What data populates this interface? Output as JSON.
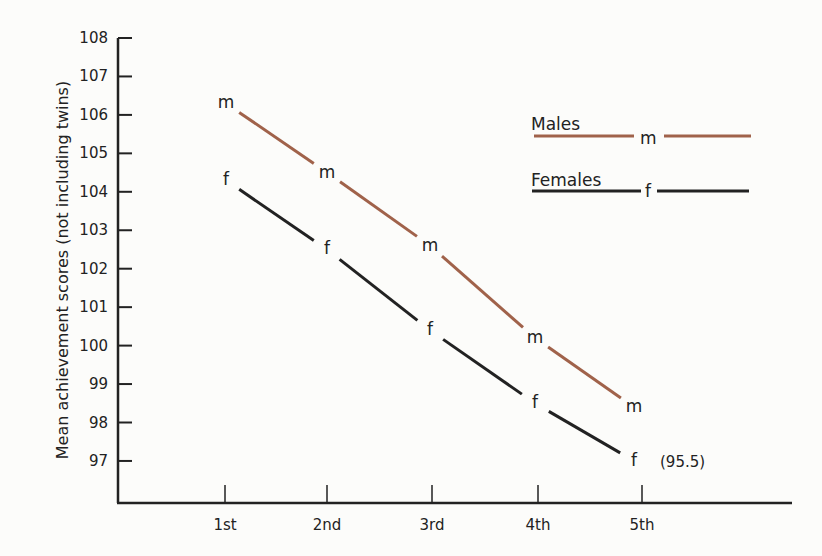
{
  "chart_data": {
    "type": "line",
    "title": "",
    "xlabel": "",
    "ylabel": "Mean achievement scores (not including twins)",
    "categories": [
      "1st",
      "2nd",
      "3rd",
      "4th",
      "5th"
    ],
    "yticks": [
      108,
      107,
      106,
      105,
      104,
      103,
      102,
      101,
      100,
      99,
      98,
      97
    ],
    "ylim": [
      96,
      108
    ],
    "grid": false,
    "legend_position": "upper right",
    "series": [
      {
        "name": "Males",
        "marker": "m",
        "color": "#a0624a",
        "values": [
          106.3,
          104.5,
          102.6,
          100.2,
          98.4
        ]
      },
      {
        "name": "Females",
        "marker": "f",
        "color": "#222222",
        "values": [
          104.3,
          102.5,
          100.4,
          98.5,
          97.0
        ]
      }
    ],
    "annotations": [
      {
        "text": "(95.5)",
        "near": "Females 5th"
      }
    ]
  },
  "legend": {
    "males": "Males",
    "males_marker": "m",
    "females": "Females",
    "females_marker": "f"
  },
  "annotation": "(95.5)"
}
